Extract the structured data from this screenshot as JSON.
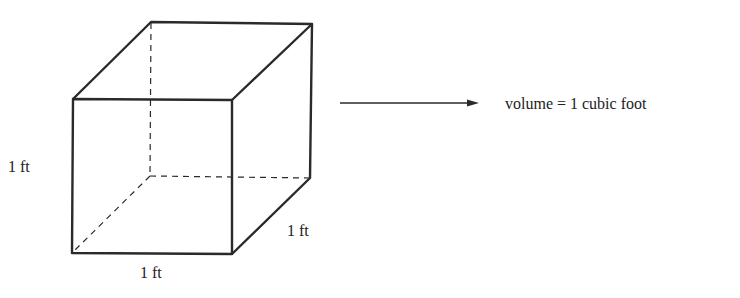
{
  "diagram": {
    "labels": {
      "height": "1 ft",
      "width": "1 ft",
      "depth": "1 ft"
    },
    "result": "volume = 1 cubic foot",
    "stroke_color": "#2a2a2a"
  }
}
